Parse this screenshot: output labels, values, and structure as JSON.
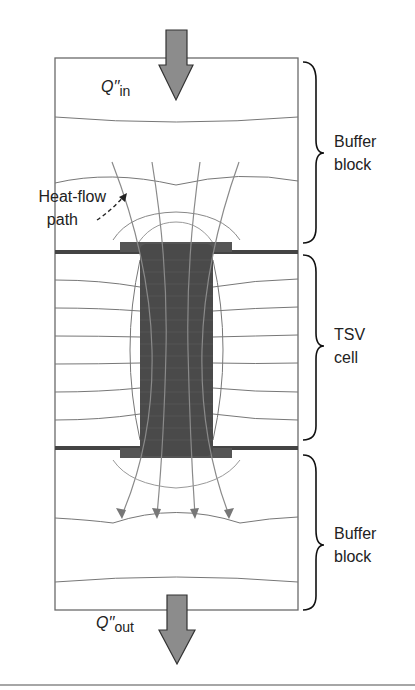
{
  "diagram": {
    "labels": {
      "q_in_symbol": "Q′′",
      "q_in_sub": "in",
      "q_out_symbol": "Q′′",
      "q_out_sub": "out",
      "heat_flow_line1": "Heat-flow",
      "heat_flow_line2": "path",
      "buffer_top_line1": "Buffer",
      "buffer_top_line2": "block",
      "tsv_line1": "TSV",
      "tsv_line2": "cell",
      "buffer_bottom_line1": "Buffer",
      "buffer_bottom_line2": "block"
    },
    "regions": [
      "Buffer block",
      "TSV cell",
      "Buffer block"
    ],
    "colors": {
      "arrow_fill": "#8c8c8c",
      "tsv_fill": "#4a4a4a",
      "line": "#777777",
      "border": "#666666"
    }
  }
}
